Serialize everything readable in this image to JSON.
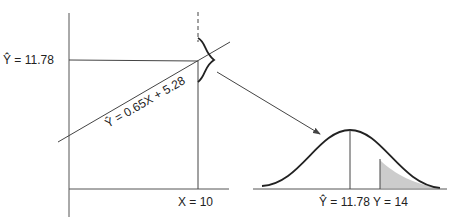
{
  "left_panel": {
    "y_hat_label": "Ŷ = 11.78",
    "regression_label": "Ŷ = 0.65X + 5.28",
    "x_label": "X = 10"
  },
  "right_panel": {
    "mean_label": "Ŷ = 11.78",
    "y_label": "Y = 14"
  },
  "colors": {
    "line": "#444444",
    "shade": "#cccccc",
    "text": "#222222"
  }
}
